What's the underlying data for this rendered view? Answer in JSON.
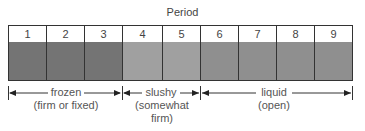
{
  "title": "Period",
  "periods": [
    {
      "number": "1",
      "zone": "frozen"
    },
    {
      "number": "2",
      "zone": "frozen"
    },
    {
      "number": "3",
      "zone": "frozen"
    },
    {
      "number": "4",
      "zone": "slushy"
    },
    {
      "number": "5",
      "zone": "slushy"
    },
    {
      "number": "6",
      "zone": "liquid"
    },
    {
      "number": "7",
      "zone": "liquid"
    },
    {
      "number": "8",
      "zone": "liquid"
    },
    {
      "number": "9",
      "zone": "liquid"
    }
  ],
  "zones": {
    "frozen": {
      "label": "frozen",
      "sublabel": "(firm or fixed)",
      "color": "#747474"
    },
    "slushy": {
      "label": "slushy",
      "sublabel_1": "(somewhat",
      "sublabel_2": "firm)",
      "color": "#a0a0a0"
    },
    "liquid": {
      "label": "liquid",
      "sublabel": "(open)",
      "color": "#8f8f8f"
    }
  }
}
